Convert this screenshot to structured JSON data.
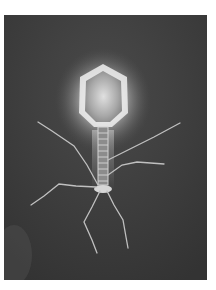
{
  "image": {
    "subject": "bacteriophage micrograph",
    "description": "Grayscale electron-microscope style image of a tailed bacteriophage with hexagonal glowing head, striated tail and six long tail fibers on a dark background",
    "colors": {
      "page_background": "#ffffff",
      "frame_background": "#3c3c3c",
      "head_glow": "#e8e8e8",
      "head_core": "#cfcfcf",
      "fibers": "#bdbdbd"
    }
  }
}
